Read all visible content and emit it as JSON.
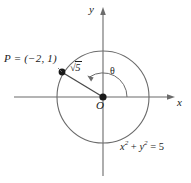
{
  "figure": {
    "kind": "unit-circle-trigonometry-diagram",
    "background_color": "#ffffff",
    "stroke_color": "#5a5a5a",
    "text_color": "#1a1a1a",
    "width": 191,
    "height": 183
  },
  "axes": {
    "x_label": "x",
    "y_label": "y",
    "origin_label": "O",
    "x_axis": {
      "x1": 14,
      "y1": 97,
      "x2": 173,
      "y2": 97,
      "arrow": "right"
    },
    "y_axis": {
      "x1": 103,
      "y1": 8,
      "x2": 103,
      "y2": 176,
      "arrow": "up"
    }
  },
  "circle": {
    "center_x": 103,
    "center_y": 97,
    "radius": 46,
    "equation_parts": {
      "x": "x",
      "x_exp": "2",
      "plus": " + ",
      "y": "y",
      "y_exp": "2",
      "equals": " = ",
      "value": "5"
    },
    "equation_text": "x² + y² = 5"
  },
  "point": {
    "label": "P = (−2, 1)",
    "name": "P",
    "coordinates": {
      "x": -2,
      "y": 1
    },
    "pixel_x": 62,
    "pixel_y": 72
  },
  "radius_segment": {
    "label_prefix": "√",
    "label_radicand": "5",
    "label_text": "√5",
    "value": 2.2360679,
    "from": {
      "x": 103,
      "y": 97
    },
    "to": {
      "x": 62,
      "y": 72
    }
  },
  "angle": {
    "label": "θ",
    "arc_radius": 24,
    "direction": "counterclockwise",
    "from_axis": "positive-x"
  }
}
